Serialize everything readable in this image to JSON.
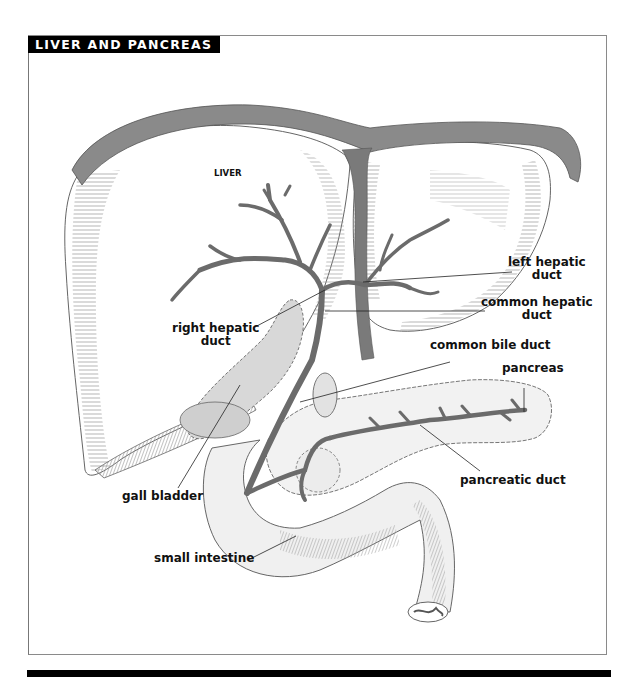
{
  "figure": {
    "title": "LIVER AND PANCREAS",
    "colors": {
      "title_bg": "#000000",
      "title_text": "#ffffff",
      "duct": "#6b6b6b",
      "ligament": "#7a7a7a",
      "frame": "#8a8a8a"
    }
  },
  "labels": {
    "liver": "LIVER",
    "left_hepatic_duct": [
      "left hepatic",
      "duct"
    ],
    "common_hepatic_duct": [
      "common hepatic",
      "duct"
    ],
    "right_hepatic_duct": [
      "right hepatic",
      "duct"
    ],
    "common_bile_duct": "common bile duct",
    "pancreas": "pancreas",
    "pancreatic_duct": "pancreatic duct",
    "gall_bladder": "gall bladder",
    "small_intestine": "small intestine"
  }
}
